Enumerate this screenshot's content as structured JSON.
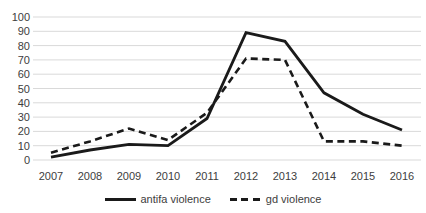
{
  "chart_data": {
    "type": "line",
    "title": "",
    "xlabel": "",
    "ylabel": "",
    "categories": [
      "2007",
      "2008",
      "2009",
      "2010",
      "2011",
      "2012",
      "2013",
      "2014",
      "2015",
      "2016"
    ],
    "series": [
      {
        "name": "antifa violence",
        "style": "solid",
        "color": "#1a1a1a",
        "values": [
          2,
          7,
          11,
          10,
          29,
          89,
          83,
          47,
          32,
          21
        ]
      },
      {
        "name": "gd violence",
        "style": "dashed",
        "color": "#1a1a1a",
        "values": [
          5,
          13,
          22,
          14,
          33,
          71,
          70,
          13,
          13,
          10
        ]
      }
    ],
    "ylim": [
      0,
      100
    ],
    "y_ticks": [
      0,
      10,
      20,
      30,
      40,
      50,
      60,
      70,
      80,
      90,
      100
    ],
    "grid": true,
    "legend_position": "bottom",
    "colors": {
      "background": "#ffffff",
      "gridline": "#d9d9d9",
      "text": "#3d3d3d"
    }
  }
}
